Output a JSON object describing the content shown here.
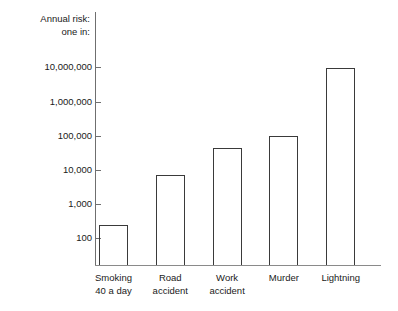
{
  "chart_data": {
    "type": "bar",
    "title": "Annual risk: one in:",
    "title_lines": [
      "Annual risk:",
      "one in:"
    ],
    "xlabel": "",
    "ylabel": "Annual risk: one in:",
    "yscale": "log",
    "ylim": [
      100,
      10000000
    ],
    "grid": false,
    "legend": false,
    "ytick_labels": [
      "10,000,000",
      "1,000,000",
      "100,000",
      "10,000",
      "1,000",
      "100"
    ],
    "ytick_values": [
      10000000,
      1000000,
      100000,
      10000,
      1000,
      100
    ],
    "categories": [
      "Smoking 40 a day",
      "Road accident",
      "Work accident",
      "Murder",
      "Lightning"
    ],
    "category_lines": [
      [
        "Smoking",
        "40 a day"
      ],
      [
        "Road",
        "accident"
      ],
      [
        "Work",
        "accident"
      ],
      [
        "Murder",
        ""
      ],
      [
        "Lightning",
        ""
      ]
    ],
    "values": [
      240,
      7000,
      45000,
      100000,
      10000000
    ],
    "bar_style": "hollow-outline",
    "colors": {
      "bar_outline": "#3a3a3a",
      "bar_fill": "transparent",
      "axis": "#6f6f6f",
      "text": "#1a1a1a",
      "background": "#ffffff"
    }
  }
}
